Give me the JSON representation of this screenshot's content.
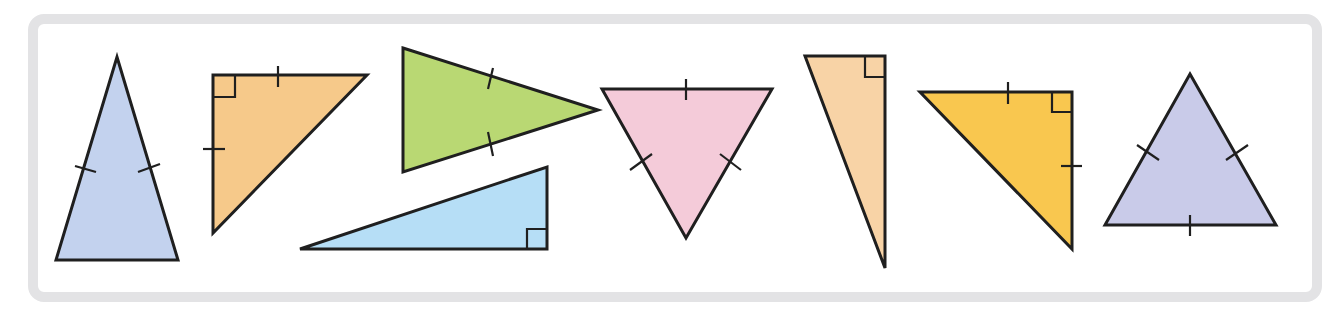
{
  "figure": {
    "stroke_color": "#1f1f1f",
    "frame_color": "#e3e3e5"
  },
  "triangles": [
    {
      "id": 1,
      "name": "blue-isosceles-triangle",
      "fill": "#c3d2ee",
      "points": [
        [
          117,
          57
        ],
        [
          178,
          260
        ],
        [
          56,
          260
        ]
      ],
      "tick_marks": [
        [
          [
            75,
            166
          ],
          [
            96,
            172
          ]
        ],
        [
          [
            138,
            172
          ],
          [
            160,
            164
          ]
        ]
      ],
      "right_angle": null,
      "type": "isosceles"
    },
    {
      "id": 2,
      "name": "orange-right-isosceles-triangle",
      "fill": "#f6c98a",
      "points": [
        [
          213,
          75
        ],
        [
          367,
          75
        ],
        [
          213,
          233
        ]
      ],
      "tick_marks": [
        [
          [
            278,
            66
          ],
          [
            278,
            87
          ]
        ],
        [
          [
            203,
            149
          ],
          [
            225,
            149
          ]
        ]
      ],
      "right_angle": [
        [
          213,
          97
        ],
        [
          235,
          97
        ],
        [
          235,
          75
        ]
      ],
      "type": "right isosceles"
    },
    {
      "id": 3,
      "name": "green-isosceles-triangle",
      "fill": "#b9d873",
      "points": [
        [
          403,
          48
        ],
        [
          598,
          110
        ],
        [
          403,
          172
        ]
      ],
      "tick_marks": [
        [
          [
            493,
            68
          ],
          [
            488,
            89
          ]
        ],
        [
          [
            488,
            132
          ],
          [
            493,
            156
          ]
        ]
      ],
      "right_angle": null,
      "type": "isosceles"
    },
    {
      "id": 4,
      "name": "light-blue-right-triangle",
      "fill": "#b6def6",
      "points": [
        [
          300,
          249
        ],
        [
          547,
          249
        ],
        [
          547,
          167
        ]
      ],
      "tick_marks": [],
      "right_angle": [
        [
          527,
          249
        ],
        [
          527,
          229
        ],
        [
          547,
          229
        ]
      ],
      "type": "right scalene"
    },
    {
      "id": 5,
      "name": "pink-equilateral-triangle",
      "fill": "#f4cbd9",
      "points": [
        [
          602,
          89
        ],
        [
          772,
          89
        ],
        [
          686,
          238
        ]
      ],
      "tick_marks": [
        [
          [
            686,
            79
          ],
          [
            686,
            100
          ]
        ],
        [
          [
            630,
            170
          ],
          [
            652,
            154
          ]
        ],
        [
          [
            720,
            154
          ],
          [
            741,
            170
          ]
        ]
      ],
      "right_angle": null,
      "type": "equilateral"
    },
    {
      "id": 6,
      "name": "peach-right-triangle",
      "fill": "#f8d3a6",
      "points": [
        [
          805,
          56
        ],
        [
          885,
          56
        ],
        [
          885,
          268
        ]
      ],
      "tick_marks": [],
      "right_angle": [
        [
          865,
          56
        ],
        [
          865,
          77
        ],
        [
          885,
          77
        ]
      ],
      "type": "right scalene"
    },
    {
      "id": 7,
      "name": "yellow-right-isosceles-triangle",
      "fill": "#f9c74f",
      "points": [
        [
          920,
          92
        ],
        [
          1072,
          92
        ],
        [
          1072,
          249
        ]
      ],
      "tick_marks": [
        [
          [
            1008,
            82
          ],
          [
            1008,
            104
          ]
        ],
        [
          [
            1061,
            166
          ],
          [
            1082,
            166
          ]
        ]
      ],
      "right_angle": [
        [
          1052,
          92
        ],
        [
          1052,
          112
        ],
        [
          1072,
          112
        ]
      ],
      "type": "right isosceles"
    },
    {
      "id": 8,
      "name": "lavender-equilateral-triangle",
      "fill": "#c9cbe9",
      "points": [
        [
          1190,
          74
        ],
        [
          1276,
          225
        ],
        [
          1105,
          225
        ]
      ],
      "tick_marks": [
        [
          [
            1137,
            145
          ],
          [
            1159,
            160
          ]
        ],
        [
          [
            1226,
            160
          ],
          [
            1248,
            145
          ]
        ],
        [
          [
            1190,
            215
          ],
          [
            1190,
            236
          ]
        ]
      ],
      "right_angle": null,
      "type": "equilateral"
    }
  ]
}
